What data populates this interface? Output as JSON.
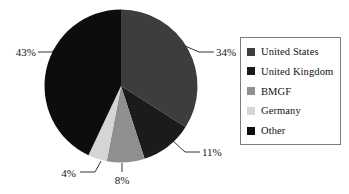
{
  "chart_data": {
    "type": "pie",
    "title": "",
    "categories": [
      "United States",
      "United Kingdom",
      "BMGF",
      "Germany",
      "Other"
    ],
    "values": [
      34,
      11,
      8,
      4,
      43
    ],
    "value_labels": [
      "34%",
      "11%",
      "8%",
      "4%",
      "43%"
    ],
    "unit": "percent",
    "start_angle_deg": 0,
    "direction": "clockwise",
    "legend_position": "right",
    "legend_border": true,
    "grid": false,
    "colors": [
      "#3d3d3d",
      "#1b1b1b",
      "#8f8f8f",
      "#d5d5d5",
      "#0d0d0d"
    ],
    "slices": [
      {
        "label": "United States",
        "value": 34,
        "display": "34%",
        "color": "#3d3d3d"
      },
      {
        "label": "United Kingdom",
        "value": 11,
        "display": "11%",
        "color": "#1b1b1b"
      },
      {
        "label": "BMGF",
        "value": 8,
        "display": "8%",
        "color": "#8f8f8f"
      },
      {
        "label": "Germany",
        "value": 4,
        "display": "4%",
        "color": "#d5d5d5"
      },
      {
        "label": "Other",
        "value": 43,
        "display": "43%",
        "color": "#0d0d0d"
      }
    ]
  },
  "legend": {
    "items": [
      {
        "label": "United States",
        "color": "#3d3d3d"
      },
      {
        "label": "United Kingdom",
        "color": "#1b1b1b"
      },
      {
        "label": "BMGF",
        "color": "#8f8f8f"
      },
      {
        "label": "Germany",
        "color": "#d5d5d5"
      },
      {
        "label": "Other",
        "color": "#0d0d0d"
      }
    ]
  },
  "labels": {
    "us": "34%",
    "uk": "11%",
    "bmgf": "8%",
    "germany": "4%",
    "other": "43%"
  }
}
